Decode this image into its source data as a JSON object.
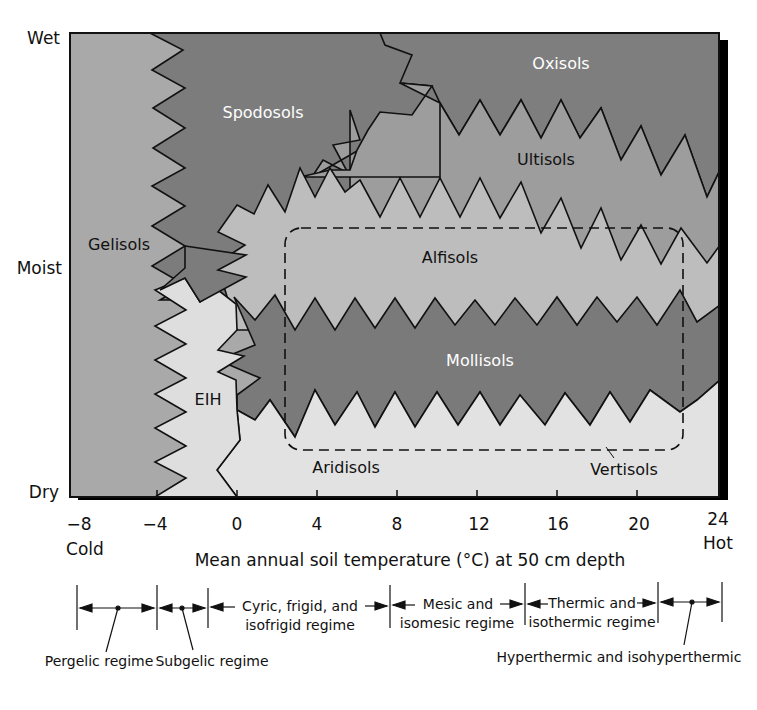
{
  "diagram": {
    "type": "soil-order-regime-diagram",
    "y_axis": {
      "labels": [
        "Wet",
        "Moist",
        "Dry"
      ]
    },
    "x_axis": {
      "title": "Mean annual soil temperature (°C) at 50 cm depth",
      "ticks": [
        "−8",
        "−4",
        "0",
        "4",
        "8",
        "12",
        "16",
        "20",
        "24"
      ],
      "tick_values": [
        -8,
        -4,
        0,
        4,
        8,
        12,
        16,
        20,
        24
      ],
      "cold_label": "Cold",
      "hot_label": "Hot"
    },
    "regions": [
      {
        "name": "Gelisols",
        "label": "Gelisols",
        "color": "#a9a9a9",
        "text_color": "#111111"
      },
      {
        "name": "Spodosols",
        "label": "Spodosols",
        "color": "#7c7c7c",
        "text_color": "#ffffff"
      },
      {
        "name": "Oxisols",
        "label": "Oxisols",
        "color": "#7e7e7e",
        "text_color": "#ffffff"
      },
      {
        "name": "Ultisols",
        "label": "Ultisols",
        "color": "#9d9d9d",
        "text_color": "#111111"
      },
      {
        "name": "Alfisols",
        "label": "Alfisols",
        "color": "#bdbdbd",
        "text_color": "#111111"
      },
      {
        "name": "Mollisols",
        "label": "Mollisols",
        "color": "#7a7a7a",
        "text_color": "#ffffff"
      },
      {
        "name": "EIH",
        "label": "EIH",
        "color": "#dedede",
        "text_color": "#111111"
      },
      {
        "name": "Aridisols",
        "label": "Aridisols",
        "color": "#e2e2e2",
        "text_color": "#111111"
      },
      {
        "name": "Vertisols",
        "label": "Vertisols",
        "color": "#e2e2e2",
        "text_color": "#111111"
      }
    ],
    "vertisols_boundary": "dashed rounded rectangle",
    "regimes": [
      {
        "name": "pergelic",
        "label": "Pergelic regime",
        "range": [
          -8,
          -4
        ]
      },
      {
        "name": "subgelic",
        "label": "Subgelic regime",
        "range": [
          -4,
          -1.5
        ]
      },
      {
        "name": "cryic",
        "label_line1": "Cyric, frigid, and",
        "label_line2": "isofrigid regime",
        "range": [
          -1.5,
          8
        ]
      },
      {
        "name": "mesic",
        "label_line1": "Mesic and",
        "label_line2": "isomesic regime",
        "range": [
          8,
          14.5
        ]
      },
      {
        "name": "thermic",
        "label_line1": "Thermic and",
        "label_line2": "isothermic regime",
        "range": [
          14.5,
          22
        ]
      },
      {
        "name": "hyperthermic",
        "label": "Hyperthermic and isohyperthermic",
        "range": [
          22,
          24
        ]
      }
    ]
  }
}
